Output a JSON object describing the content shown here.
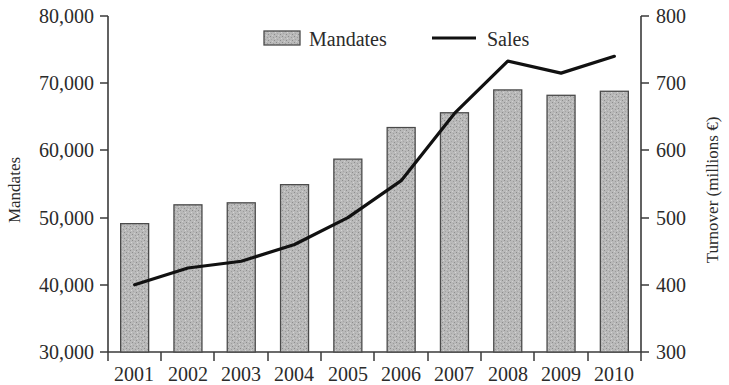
{
  "chart_data": {
    "type": "bar",
    "title": "",
    "subtitle": "",
    "xlabel": "",
    "categories": [
      "2001",
      "2002",
      "2003",
      "2004",
      "2005",
      "2006",
      "2007",
      "2008",
      "2009",
      "2010"
    ],
    "grid": false,
    "legend_position": "top-center",
    "axes": {
      "left": {
        "label": "Mandates",
        "min": 30000,
        "max": 80000,
        "step": 10000,
        "tick_labels": [
          "30,000",
          "40,000",
          "50,000",
          "60,000",
          "70,000",
          "80,000"
        ],
        "tick_values": [
          30000,
          40000,
          50000,
          60000,
          70000,
          80000
        ]
      },
      "right": {
        "label": "Turnover (millions €)",
        "min": 300,
        "max": 800,
        "step": 100,
        "tick_labels": [
          "300",
          "400",
          "500",
          "600",
          "700",
          "800"
        ],
        "tick_values": [
          300,
          400,
          500,
          600,
          700,
          800
        ]
      }
    },
    "series": [
      {
        "name": "Mandates",
        "type": "bar",
        "axis": "left",
        "color": "#b3b3b3",
        "edge_color": "#4a4a4a",
        "values": [
          49100,
          51900,
          52200,
          54900,
          58700,
          63400,
          65600,
          69000,
          68200,
          68800
        ]
      },
      {
        "name": "Sales",
        "type": "line",
        "axis": "right",
        "color": "#111111",
        "values": [
          400,
          425,
          435,
          460,
          500,
          555,
          655,
          733,
          715,
          740
        ]
      }
    ]
  },
  "legend": {
    "entries": [
      {
        "label": "Mandates",
        "marker": "bar-swatch-icon"
      },
      {
        "label": "Sales",
        "marker": "line-swatch-icon"
      }
    ]
  },
  "axis_titles": {
    "left": "Mandates",
    "right": "Turnover (millions €)"
  },
  "tick_labels": {
    "left": [
      "80,000",
      "70,000",
      "60,000",
      "50,000",
      "40,000",
      "30,000"
    ],
    "right": [
      "800",
      "700",
      "600",
      "500",
      "400",
      "300"
    ],
    "bottom": [
      "2001",
      "2002",
      "2003",
      "2004",
      "2005",
      "2006",
      "2007",
      "2008",
      "2009",
      "2010"
    ]
  }
}
